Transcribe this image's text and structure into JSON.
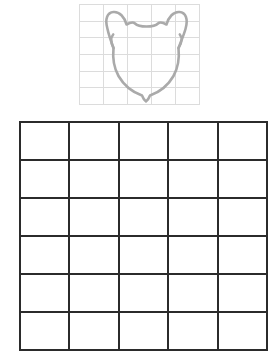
{
  "page": {
    "background_color": "#ffffff",
    "width": 277,
    "height": 336
  },
  "reference_panel": {
    "name": "reference-grid-with-drawing",
    "columns": 5,
    "rows": 6,
    "line_color": "#dcdcdc",
    "line_width": 1,
    "drawing": {
      "name": "bear-head-outline",
      "description": "Bear head outline with two rounded ears and a small chin bump",
      "stroke_color": "#aaaaaa",
      "stroke_width": 2.6,
      "fill": "none"
    }
  },
  "worksheet_panel": {
    "name": "blank-worksheet-grid",
    "columns": 5,
    "rows": 6,
    "line_color": "#2b2b2b",
    "line_width": 2,
    "cells_empty": true,
    "clipped_at_bottom": true
  }
}
